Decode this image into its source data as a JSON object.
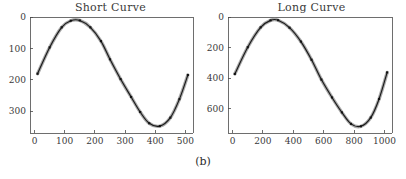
{
  "figure": {
    "subfigure_label": "(b)",
    "background_color": "#ffffff",
    "curve_color": "#1a1a1a",
    "halo_color": "#9a9a9a",
    "marker_color": "#111111",
    "axis_color": "#4a4a4a"
  },
  "panels": [
    {
      "id": "short-curve",
      "title": "Short Curve"
    },
    {
      "id": "long-curve",
      "title": "Long Curve"
    }
  ],
  "chart_data": [
    {
      "type": "line",
      "title": "Short Curve",
      "xlabel": "",
      "ylabel": "",
      "grid": false,
      "legend": null,
      "y_axis_inverted": true,
      "xlim": [
        -15,
        525
      ],
      "ylim": [
        0,
        370
      ],
      "xticks": [
        0,
        100,
        200,
        300,
        400,
        500
      ],
      "yticks": [
        0,
        100,
        200,
        300
      ],
      "xticklabels": [
        "0",
        "100",
        "200",
        "300",
        "400",
        "500"
      ],
      "yticklabels": [
        "0",
        "100",
        "200",
        "300"
      ],
      "series": [
        {
          "name": "short",
          "marker": "square",
          "x": [
            10,
            50,
            90,
            120,
            150,
            185,
            220,
            250,
            285,
            320,
            350,
            380,
            415,
            450,
            480,
            508
          ],
          "y": [
            181,
            97,
            33,
            12,
            11,
            33,
            77,
            135,
            198,
            255,
            303,
            339,
            348,
            321,
            262,
            185
          ]
        }
      ]
    },
    {
      "type": "line",
      "title": "Long Curve",
      "xlabel": "",
      "ylabel": "",
      "grid": false,
      "legend": null,
      "y_axis_inverted": true,
      "xlim": [
        -30,
        1050
      ],
      "ylim": [
        0,
        760
      ],
      "xticks": [
        0,
        200,
        400,
        600,
        800,
        1000
      ],
      "yticks": [
        0,
        200,
        400,
        600
      ],
      "xticklabels": [
        "0",
        "200",
        "400",
        "600",
        "800",
        "1000"
      ],
      "yticklabels": [
        "0",
        "200",
        "400",
        "600"
      ],
      "series": [
        {
          "name": "long",
          "marker": "square",
          "x": [
            15,
            100,
            185,
            250,
            300,
            375,
            450,
            520,
            585,
            655,
            720,
            780,
            845,
            910,
            965,
            1018
          ],
          "y": [
            373,
            198,
            68,
            22,
            21,
            70,
            161,
            280,
            410,
            527,
            625,
            700,
            716,
            659,
            537,
            363
          ]
        }
      ]
    }
  ]
}
